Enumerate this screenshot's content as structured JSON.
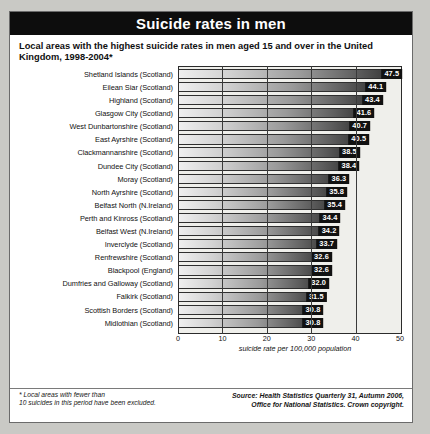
{
  "header": {
    "title": "Suicide rates in men",
    "subtitle": "Local areas with the highest suicide rates in men aged 15 and over in the United Kingdom, 1998-2004*"
  },
  "footer": {
    "note_line1": "* Local areas with fewer than",
    "note_line2": "10 suicides in this period have been excluded.",
    "source_line1": "Source: Health Statistics Quarterly 31, Autumn 2006,",
    "source_line2": "Office for National Statistics. Crown copyright."
  },
  "chart_data": {
    "type": "bar",
    "orientation": "horizontal",
    "title": "Suicide rates in men",
    "subtitle": "Local areas with the highest suicide rates in men aged 15 and over in the United Kingdom, 1998-2004*",
    "xlabel": "suicide rate per 100,000 population",
    "ylabel": "",
    "xlim": [
      0,
      50
    ],
    "grid": true,
    "legend": "none",
    "xticks": [
      "0",
      "10",
      "20",
      "30",
      "40",
      "50"
    ],
    "xtick_values": [
      0,
      10,
      20,
      30,
      40,
      50
    ],
    "categories": [
      "Shetland Islands (Scotland)",
      "Eilean Siar (Scotland)",
      "Highland (Scotland)",
      "Glasgow City (Scotland)",
      "West Dunbartonshire (Scotland)",
      "East Ayrshire (Scotland)",
      "Clackmannanshire (Scotland)",
      "Dundee City (Scotland)",
      "Moray (Scotland)",
      "North Ayrshire (Scotland)",
      "Belfast North (N.Ireland)",
      "Perth and Kinross (Scotland)",
      "Belfast West (N.Ireland)",
      "Inverclyde (Scotland)",
      "Renfrewshire (Scotland)",
      "Blackpool (England)",
      "Dumfries and Galloway (Scotland)",
      "Falkirk (Scotland)",
      "Scottish Borders (Scotland)",
      "Midlothian (Scotland)"
    ],
    "values": [
      47.5,
      44.1,
      43.4,
      41.6,
      40.7,
      40.5,
      38.5,
      38.4,
      36.3,
      35.8,
      35.4,
      34.4,
      34.2,
      33.7,
      32.6,
      32.6,
      32.0,
      31.5,
      30.8,
      30.8
    ],
    "value_labels": [
      "47.5",
      "44.1",
      "43.4",
      "41.6",
      "40.7",
      "40.5",
      "38.5",
      "38.4",
      "36.3",
      "35.8",
      "35.4",
      "34.4",
      "34.2",
      "33.7",
      "32.6",
      "32.6",
      "32.0",
      "31.5",
      "30.8",
      "30.8"
    ]
  },
  "colors": {
    "title_bar_bg": "#0d0d0d",
    "title_text": "#ffffff",
    "plot_bg": "#efefeb",
    "bar_light": "#efefef",
    "bar_dark": "#2a2a2a",
    "label_box": "#111111",
    "page_bg": "#ffffff",
    "outer_bg": "#c9c9c5"
  }
}
